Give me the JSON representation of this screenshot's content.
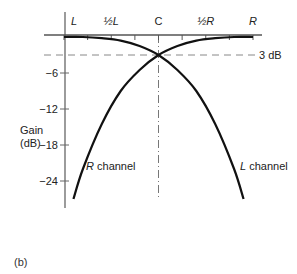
{
  "figure_label": "(b)",
  "chart_data": {
    "type": "line",
    "title": "",
    "xlabel": "",
    "ylabel": "Gain (dB)",
    "ylabel_lines": [
      "Gain",
      "(dB)"
    ],
    "x_tick_labels": [
      {
        "pos": 0,
        "text": "L",
        "italic": true
      },
      {
        "pos": 0.25,
        "text": "½L",
        "italic": true
      },
      {
        "pos": 0.5,
        "text": "C",
        "italic": false
      },
      {
        "pos": 0.75,
        "text": "½R",
        "italic": true
      },
      {
        "pos": 1,
        "text": "R",
        "italic": true
      }
    ],
    "x_ticks": [
      0,
      0.125,
      0.25,
      0.375,
      0.5,
      0.625,
      0.75,
      0.875,
      1
    ],
    "y_ticks": [
      -6,
      -12,
      -18,
      -24
    ],
    "y_tick_labels": [
      "−6",
      "−12",
      "−18",
      "−24"
    ],
    "ylim": [
      -30,
      0
    ],
    "reference_line": {
      "y": -3,
      "label": "3 dB",
      "style": "dashed"
    },
    "center_line": {
      "x": 0.5,
      "style": "dash-dot"
    },
    "series": [
      {
        "name": "R channel",
        "label_text": [
          "R",
          " channel"
        ],
        "x": [
          0.05,
          0.1,
          0.2,
          0.3,
          0.4,
          0.5,
          0.6,
          0.7,
          0.8,
          0.9,
          1.0
        ],
        "y": [
          -27,
          -22,
          -14.5,
          -9,
          -5.5,
          -3,
          -1.5,
          -0.6,
          -0.2,
          0,
          0
        ]
      },
      {
        "name": "L channel",
        "label_text": [
          "L",
          " channel"
        ],
        "x": [
          0.0,
          0.1,
          0.2,
          0.3,
          0.4,
          0.5,
          0.6,
          0.7,
          0.8,
          0.9,
          0.95
        ],
        "y": [
          0,
          0,
          -0.2,
          -0.6,
          -1.5,
          -3,
          -5.5,
          -9,
          -14.5,
          -22,
          -27
        ]
      }
    ],
    "grid": false,
    "legend": "inline labels"
  }
}
